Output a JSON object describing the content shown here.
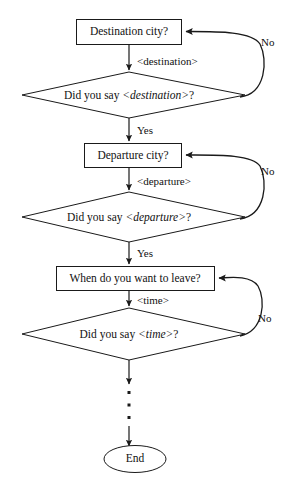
{
  "diagram": {
    "type": "flowchart",
    "colors": {
      "background": "#ffffff",
      "stroke": "#1a1a1a",
      "text": "#111111",
      "node_fill": "#ffffff"
    },
    "nodes": [
      {
        "id": "prompt-destination",
        "shape": "rectangle",
        "label": "Destination city?"
      },
      {
        "id": "confirm-destination",
        "shape": "diamond",
        "label_prefix": "Did you say ",
        "label_variable": "<destination>",
        "label_suffix": "?"
      },
      {
        "id": "prompt-departure",
        "shape": "rectangle",
        "label": "Departure city?"
      },
      {
        "id": "confirm-departure",
        "shape": "diamond",
        "label_prefix": "Did you say ",
        "label_variable": "<departure>",
        "label_suffix": "?"
      },
      {
        "id": "prompt-time",
        "shape": "rectangle",
        "label": "When do you want to leave?"
      },
      {
        "id": "confirm-time",
        "shape": "diamond",
        "label_prefix": "Did you say ",
        "label_variable": "<time>",
        "label_suffix": "?"
      },
      {
        "id": "end-node",
        "shape": "ellipse",
        "label": "End"
      }
    ],
    "edge_labels": {
      "destination_slot": "<destination>",
      "departure_slot": "<departure>",
      "time_slot": "<time>",
      "yes_destination": "Yes",
      "yes_departure": "Yes",
      "no_destination": "No",
      "no_departure": "No",
      "no_time": "No"
    },
    "continuation": {
      "marker": "vertical-ellipsis",
      "dot_count": 3
    }
  }
}
